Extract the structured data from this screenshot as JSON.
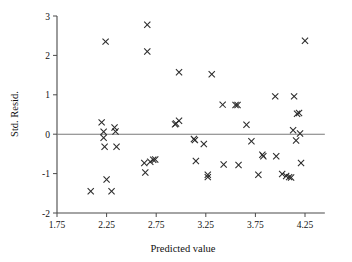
{
  "chart_data": {
    "type": "scatter",
    "title": "",
    "xlabel": "Predicted value",
    "ylabel": "Std. Resid.",
    "xlim": [
      1.7,
      4.45
    ],
    "ylim": [
      -2,
      3
    ],
    "xticks": [
      "1.75",
      "2.25",
      "2.75",
      "3.25",
      "3.75",
      "4.25"
    ],
    "xtick_values": [
      1.75,
      2.25,
      2.75,
      3.25,
      3.75,
      4.25
    ],
    "yticks": [
      "3",
      "2",
      "1",
      "0",
      "-1",
      "-2"
    ],
    "ytick_values": [
      3,
      2,
      1,
      0,
      -1,
      -2
    ],
    "grid": false,
    "legend": null,
    "reference_lines": [
      {
        "axis": "y",
        "value": 0
      }
    ],
    "marker": "x",
    "marker_color": "#2b2b2b",
    "series": [
      {
        "name": "Standardized residuals",
        "points": [
          [
            2.2,
            0.3
          ],
          [
            2.24,
            2.35
          ],
          [
            2.09,
            -1.45
          ],
          [
            2.22,
            0.06
          ],
          [
            2.22,
            -0.09
          ],
          [
            2.23,
            -0.32
          ],
          [
            2.25,
            -1.15
          ],
          [
            2.3,
            -1.45
          ],
          [
            2.33,
            0.17
          ],
          [
            2.34,
            0.07
          ],
          [
            2.35,
            -0.32
          ],
          [
            2.63,
            -0.73
          ],
          [
            2.64,
            -0.97
          ],
          [
            2.66,
            2.78
          ],
          [
            2.66,
            2.1
          ],
          [
            2.69,
            -0.7
          ],
          [
            2.72,
            -0.65
          ],
          [
            2.74,
            -0.64
          ],
          [
            2.94,
            0.25
          ],
          [
            2.95,
            0.27
          ],
          [
            2.98,
            0.34
          ],
          [
            2.98,
            1.57
          ],
          [
            3.13,
            -0.12
          ],
          [
            3.14,
            -0.15
          ],
          [
            3.15,
            -0.68
          ],
          [
            3.23,
            -0.25
          ],
          [
            3.27,
            -1.03
          ],
          [
            3.27,
            -1.09
          ],
          [
            3.31,
            1.52
          ],
          [
            3.42,
            0.75
          ],
          [
            3.43,
            -0.77
          ],
          [
            3.55,
            0.74
          ],
          [
            3.57,
            0.74
          ],
          [
            3.58,
            -0.78
          ],
          [
            3.66,
            0.24
          ],
          [
            3.71,
            -0.18
          ],
          [
            3.78,
            -1.03
          ],
          [
            3.82,
            -0.52
          ],
          [
            3.83,
            -0.56
          ],
          [
            3.95,
            0.96
          ],
          [
            3.96,
            -0.56
          ],
          [
            4.02,
            -1.01
          ],
          [
            4.06,
            -1.06
          ],
          [
            4.09,
            -1.09
          ],
          [
            4.11,
            -1.1
          ],
          [
            4.13,
            0.1
          ],
          [
            4.14,
            0.96
          ],
          [
            4.16,
            -0.16
          ],
          [
            4.17,
            0.52
          ],
          [
            4.19,
            0.54
          ],
          [
            4.2,
            0.02
          ],
          [
            4.21,
            -0.73
          ],
          [
            4.25,
            2.37
          ]
        ]
      }
    ]
  }
}
